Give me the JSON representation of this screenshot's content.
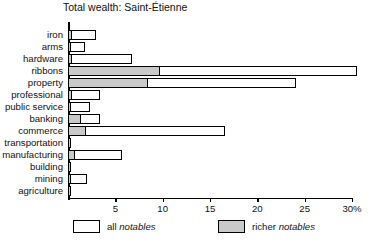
{
  "chart_data": {
    "type": "bar",
    "orientation": "horizontal",
    "title": "Total wealth: Saint-Étienne",
    "xlabel": "",
    "ylabel": "",
    "xlim": [
      0,
      30
    ],
    "xunit": "%",
    "grid": false,
    "legend_position": "bottom",
    "categories": [
      "iron",
      "arms",
      "hardware",
      "ribbons",
      "property",
      "professional",
      "public service",
      "banking",
      "commerce",
      "transportation",
      "manufacturing",
      "building",
      "mining",
      "agriculture"
    ],
    "series": [
      {
        "name": "all notables",
        "style": "white",
        "values": [
          3.0,
          1.8,
          6.8,
          30.5,
          24.1,
          3.4,
          2.3,
          3.4,
          16.6,
          0.3,
          5.7,
          0.3,
          2.0,
          0.2
        ]
      },
      {
        "name": "richer notables",
        "style": "gray",
        "values": [
          0.4,
          0.2,
          0.4,
          9.7,
          8.5,
          0.4,
          0.2,
          1.4,
          1.9,
          0.2,
          0.7,
          0.2,
          0.2,
          0.2
        ]
      }
    ],
    "xticks": [
      {
        "value": 0,
        "label": ""
      },
      {
        "value": 5,
        "label": "5"
      },
      {
        "value": 10,
        "label": "10"
      },
      {
        "value": 15,
        "label": "15"
      },
      {
        "value": 20,
        "label": "20"
      },
      {
        "value": 25,
        "label": "25"
      },
      {
        "value": 30,
        "label": "30%"
      }
    ],
    "legend": [
      {
        "label_plain": "all ",
        "label_italic": "notables",
        "swatch": "white"
      },
      {
        "label_plain": "richer ",
        "label_italic": "notables",
        "swatch": "gray"
      }
    ],
    "colors": {
      "all_notables_fill": "#ffffff",
      "richer_notables_fill": "#c9c9c9",
      "outline": "#000000",
      "background": "#ffffff"
    }
  }
}
